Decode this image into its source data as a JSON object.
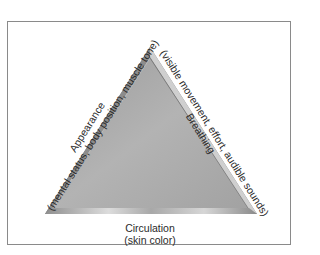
{
  "diagram": {
    "type": "pediatric-assessment-triangle",
    "shape": "equilateral-triangle",
    "colors": {
      "triangle_fill": "#a9a9a9",
      "bevel_light": "#d8d8d8",
      "bevel_dark": "#6e6e6e",
      "frame_border": "#8a8a8a",
      "text": "#2a2a2a"
    },
    "sides": {
      "left": {
        "title": "Appearance",
        "detail": "(mental status, body position, muscle tone)"
      },
      "right": {
        "title": "Breathing",
        "detail": "(visible movement, effort, audible sounds)"
      },
      "bottom": {
        "title": "Circulation",
        "detail": "(skin color)"
      }
    }
  }
}
